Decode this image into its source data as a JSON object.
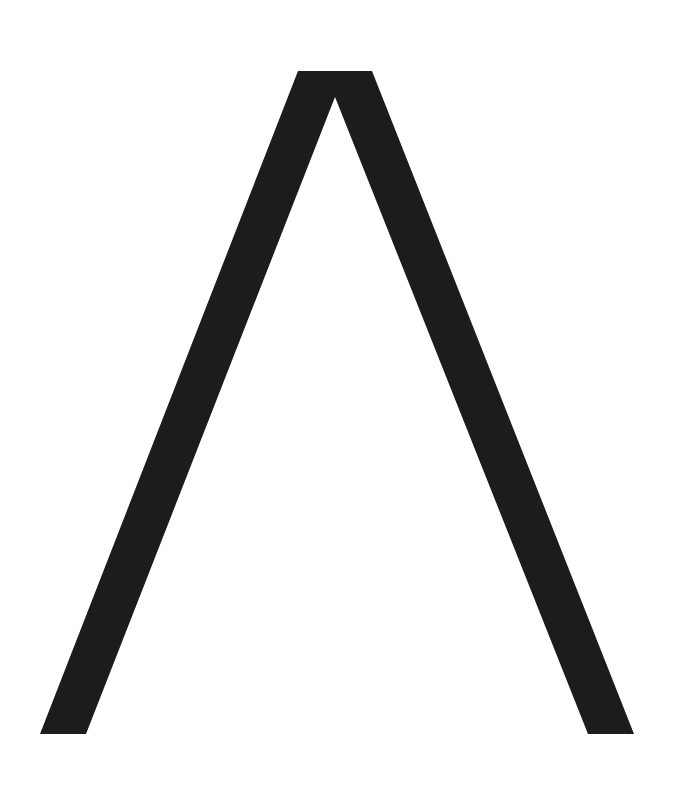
{
  "glyph": {
    "character": "Λ",
    "name": "Greek capital letter Lambda",
    "fill_color": "#1c1c1c",
    "background_color": "#ffffff",
    "points": "298,71 372,71 634,734 588,734 335,97 86,734 40,734"
  }
}
